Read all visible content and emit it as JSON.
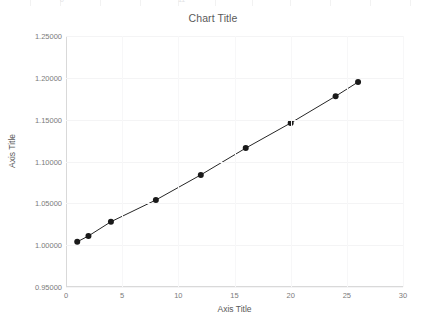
{
  "top_strip": {
    "ghost_cells": [
      {
        "text": "0",
        "left": 60
      },
      {
        "text": "11",
        "left": 178
      }
    ],
    "column_edges": [
      0,
      30,
      60,
      100,
      140,
      178,
      215,
      252,
      290,
      330,
      370,
      410
    ]
  },
  "chart_data": {
    "type": "line",
    "title": "Chart Title",
    "xlabel": "Axis Title",
    "ylabel": "Axis Title",
    "xlim": [
      0,
      30
    ],
    "ylim": [
      0.95,
      1.25
    ],
    "xticks": [
      0,
      5,
      10,
      15,
      20,
      25,
      30
    ],
    "yticks": [
      "0.95000",
      "1.00000",
      "1.05000",
      "1.10000",
      "1.15000",
      "1.20000",
      "1.25000"
    ],
    "ytick_values": [
      0.95,
      1.0,
      1.05,
      1.1,
      1.15,
      1.2,
      1.25
    ],
    "grid": true,
    "legend": false,
    "marker": "circle",
    "marker_color": "#1a1a1a",
    "line_color": "#262626",
    "series": [
      {
        "name": "Series 1",
        "x": [
          1,
          2,
          4,
          8,
          12,
          16,
          20,
          24,
          26
        ],
        "y": [
          1.004,
          1.011,
          1.028,
          1.054,
          1.084,
          1.116,
          1.146,
          1.178,
          1.195
        ]
      }
    ]
  },
  "colors": {
    "plot_border": "#d9d9d9",
    "gridline": "#f4f4f5",
    "text": "#595959",
    "tick_text": "#7b7b7b"
  }
}
